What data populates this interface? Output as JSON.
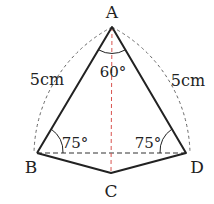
{
  "figure": {
    "vertices": {
      "A": {
        "label": "A",
        "x": 112,
        "y": 27
      },
      "B": {
        "label": "B",
        "x": 37,
        "y": 153
      },
      "C": {
        "label": "C",
        "x": 111,
        "y": 173
      },
      "D": {
        "label": "D",
        "x": 186,
        "y": 153
      }
    },
    "side_labels": {
      "AB": "5cm",
      "AD": "5cm"
    },
    "angle_labels": {
      "A": "60°",
      "B": "75°",
      "D": "75°"
    },
    "colors": {
      "lines": "#222222",
      "dashed": "#555555",
      "axis": "#d9534f"
    }
  }
}
